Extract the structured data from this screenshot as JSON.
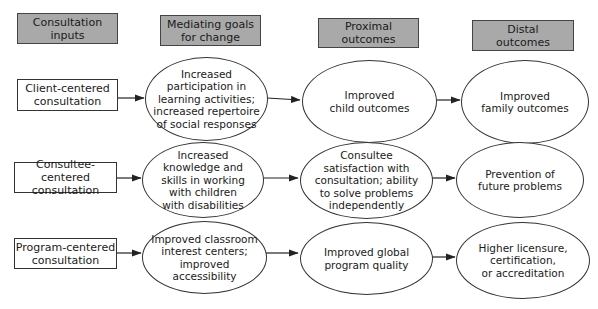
{
  "headers": [
    {
      "label": "Consultation\ninputs"
    },
    {
      "label": "Mediating goals\nfor change"
    },
    {
      "label": "Proximal\noutcomes"
    },
    {
      "label": "Distal\noutcomes"
    }
  ],
  "rows": [
    {
      "input": "Client-centered\nconsultation",
      "mediating": "Increased\nparticipation in\nlearning activities;\nincreased repertoire\nof social responses",
      "proximal": "Improved\nchild outcomes",
      "distal": "Improved\nfamily outcomes"
    },
    {
      "input": "Consultee-centered\nconsultation",
      "mediating": "Increased\nknowledge and\nskills in working\nwith children\nwith disabilities",
      "proximal": "Consultee\nsatisfaction with\nconsultation; ability\nto solve problems\nindependently",
      "distal": "Prevention of\nfuture problems"
    },
    {
      "input": "Program-centered\nconsultation",
      "mediating": "Improved classroom\ninterest centers;\nimproved\naccessibility",
      "proximal": "Improved global\nprogram quality",
      "distal": "Higher licensure,\ncertification,\nor accreditation"
    }
  ],
  "colors": {
    "header_fill": "#a9a9a9",
    "stroke": "#333333"
  }
}
